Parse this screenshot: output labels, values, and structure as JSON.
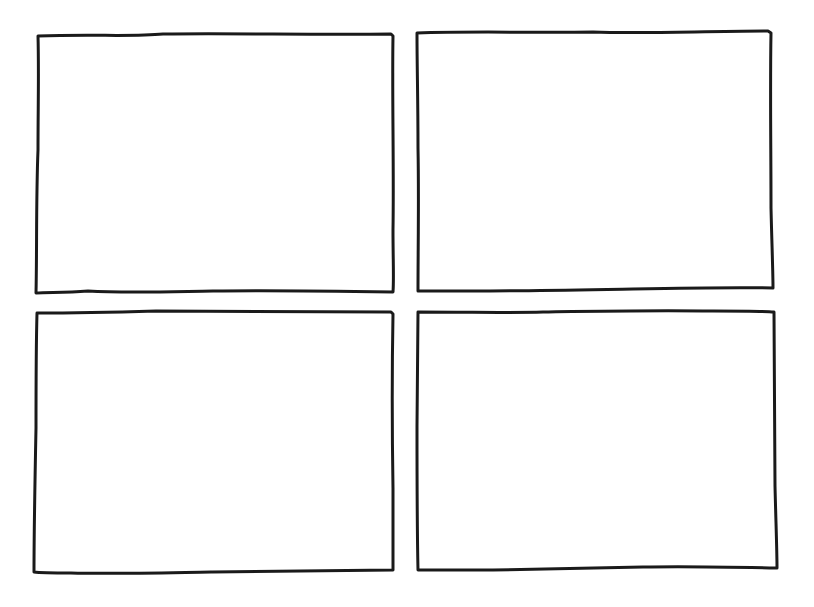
{
  "diagram": {
    "type": "comic-grid",
    "layout": {
      "rows": 2,
      "columns": 2
    },
    "stroke_color": "#1a1a1a",
    "background": "#ffffff",
    "panels": [
      {
        "id": "panel-1",
        "position": "top-left",
        "content": ""
      },
      {
        "id": "panel-2",
        "position": "top-right",
        "content": ""
      },
      {
        "id": "panel-3",
        "position": "bottom-left",
        "content": ""
      },
      {
        "id": "panel-4",
        "position": "bottom-right",
        "content": ""
      }
    ]
  }
}
